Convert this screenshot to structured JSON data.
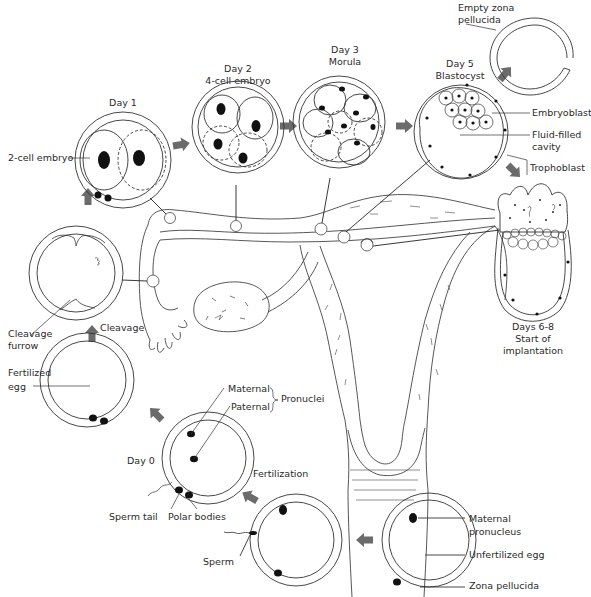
{
  "diagram": {
    "stages": [
      {
        "id": "unfertilized",
        "labels": [
          "Maternal pronucleus",
          "Unfertilized egg",
          "Zona pellucida"
        ]
      },
      {
        "id": "fertilization",
        "labels": [
          "Sperm",
          "Fertilization"
        ]
      },
      {
        "id": "day0",
        "day": "Day 0",
        "labels": [
          "Maternal",
          "Paternal",
          "Pronuclei",
          "Sperm tail",
          "Polar bodies"
        ]
      },
      {
        "id": "fertilized",
        "labels": [
          "Fertilized egg"
        ]
      },
      {
        "id": "cleavage",
        "labels": [
          "Cleavage",
          "Cleavage furrow"
        ]
      },
      {
        "id": "day1",
        "day": "Day 1",
        "labels": [
          "2-cell embryo"
        ]
      },
      {
        "id": "day2",
        "day": "Day 2",
        "labels": [
          "4-cell embryo"
        ]
      },
      {
        "id": "day3",
        "day": "Day 3",
        "labels": [
          "Morula"
        ]
      },
      {
        "id": "day5",
        "day": "Day 5",
        "labels": [
          "Blastocyst",
          "Embryoblast",
          "Fluid-filled cavity",
          "Trophoblast"
        ]
      },
      {
        "id": "hatching",
        "labels": [
          "Empty zona pellucida"
        ]
      },
      {
        "id": "implantation",
        "day": "Days 6-8",
        "labels": [
          "Start of implantation"
        ]
      }
    ]
  },
  "labels": {
    "day1": "Day 1",
    "two_cell": "2-cell embryo",
    "day2": "Day 2",
    "four_cell": "4-cell embryo",
    "day3": "Day 3",
    "morula": "Morula",
    "day5": "Day 5",
    "blastocyst": "Blastocyst",
    "empty_zona_1": "Empty zona",
    "empty_zona_2": "pellucida",
    "embryoblast": "Embryoblast",
    "fluid_1": "Fluid-filled",
    "fluid_2": "cavity",
    "trophoblast": "Trophoblast",
    "days68": "Days 6-8",
    "start_of": "Start of",
    "implantation": "implantation",
    "cleavage_furrow_1": "Cleavage",
    "cleavage_furrow_2": "furrow",
    "cleavage": "Cleavage",
    "fertilized_1": "Fertilized",
    "fertilized_2": "egg",
    "maternal": "Maternal",
    "paternal": "Paternal",
    "pronuclei": "Pronuclei",
    "day0": "Day 0",
    "fertilization": "Fertilization",
    "sperm_tail": "Sperm tail",
    "polar_bodies": "Polar bodies",
    "sperm": "Sperm",
    "maternal_pronucleus_1": "Maternal",
    "maternal_pronucleus_2": "pronucleus",
    "unfertilized_egg": "Unfertilized egg",
    "zona_pellucida": "Zona pellucida"
  },
  "colors": {
    "line": "#333333",
    "arrow": "#6b6b6b",
    "nucleus": "#111111"
  }
}
